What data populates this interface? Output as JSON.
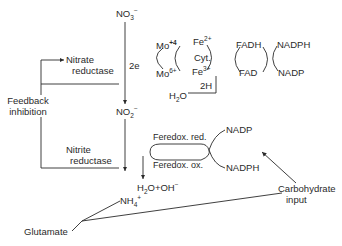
{
  "diagram": {
    "type": "pathway",
    "nodes": {
      "nitrate": {
        "base": "NO",
        "sub": "3",
        "sup": "−"
      },
      "nitrite": {
        "base": "NO",
        "sub": "2",
        "sup": "−"
      },
      "ammonium": {
        "base": "NH",
        "sub": "4",
        "sup": "+"
      },
      "glutamate": "Glutamate",
      "carbohydrate_input_line1": "Carbohydrate",
      "carbohydrate_input_line2": "input",
      "water": {
        "base": "H",
        "sub": "2",
        "tail": "O"
      },
      "water_hydroxide": {
        "base": "H",
        "sub": "2",
        "tail": "O+OH",
        "sup": "−"
      }
    },
    "enzymes": {
      "nitrate_reductase_line1": "Nitrate",
      "nitrate_reductase_line2": "reductase",
      "nitrite_reductase_line1": "Nitrite",
      "nitrite_reductase_line2": "reductase"
    },
    "feedback": {
      "line1": "Feedback",
      "line2": "inhibition"
    },
    "electron_label": "2e",
    "hydrogen_label": "2H",
    "molybdenum": {
      "top": {
        "base": "Mo",
        "sup": "+4"
      },
      "bottom": {
        "base": "Mo",
        "sup": "6+"
      }
    },
    "cytochrome": {
      "top": {
        "base": "Fe",
        "sup": "2+"
      },
      "middle": "Cyt.",
      "bottom": {
        "base": "Fe",
        "sup": "3+"
      }
    },
    "flavin": {
      "top": "FADH",
      "bottom": "FAD"
    },
    "nadp_upper": {
      "top": "NADPH",
      "bottom": "NADP"
    },
    "ferredoxin": {
      "reduced": "Feredox. red.",
      "oxidized": "Feredox. ox."
    },
    "nadp_lower": {
      "top": "NADP",
      "bottom": "NADPH"
    }
  }
}
